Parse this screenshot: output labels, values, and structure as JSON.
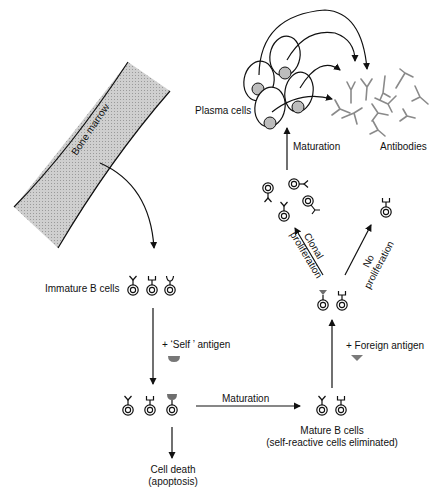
{
  "diagram": {
    "colors": {
      "line": "#111111",
      "antibody": "#8a8a8a",
      "antigen": "#7a7a7a",
      "bone_fill": "#c8c8c8",
      "nucleus_fill": "#bdbdbd"
    },
    "nodes": {
      "bone_marrow": {
        "label": "Bone marrow"
      },
      "immature_b_cells": {
        "label": "Immature B cells"
      },
      "self_antigen": {
        "label": "+ ‘Self ’ antigen"
      },
      "maturation_horizontal": {
        "label": "Maturation"
      },
      "cell_death": {
        "line1": "Cell death",
        "line2": "(apoptosis)"
      },
      "mature_b_cells": {
        "line1": "Mature B cells",
        "line2": "(self-reactive cells eliminated)"
      },
      "foreign_antigen": {
        "label": "+ Foreign antigen"
      },
      "clonal_proliferation": {
        "line1": "Clonal",
        "line2": "proliferation"
      },
      "no_proliferation": {
        "line1": "No",
        "line2": "proliferation"
      },
      "maturation_vertical": {
        "label": "Maturation"
      },
      "plasma_cells": {
        "label": "Plasma cells"
      },
      "antibodies": {
        "label": "Antibodies"
      }
    },
    "edges": [
      {
        "from": "bone_marrow",
        "to": "immature_b_cells"
      },
      {
        "from": "immature_b_cells",
        "to": "self_antigen_bound_cells",
        "label": "+ 'Self ' antigen"
      },
      {
        "from": "self_antigen_bound_cells",
        "to": "cell_death"
      },
      {
        "from": "self_antigen_bound_cells",
        "to": "mature_b_cells",
        "label": "Maturation"
      },
      {
        "from": "mature_b_cells",
        "to": "foreign_antigen_bound_cells",
        "label": "+ Foreign antigen"
      },
      {
        "from": "foreign_antigen_bound_cells",
        "to": "clonal_cells",
        "label": "Clonal proliferation"
      },
      {
        "from": "foreign_antigen_bound_cells",
        "to": "unbound_cell",
        "label": "No proliferation"
      },
      {
        "from": "clonal_cells",
        "to": "plasma_cells",
        "label": "Maturation"
      },
      {
        "from": "plasma_cells",
        "to": "antibodies"
      }
    ]
  }
}
